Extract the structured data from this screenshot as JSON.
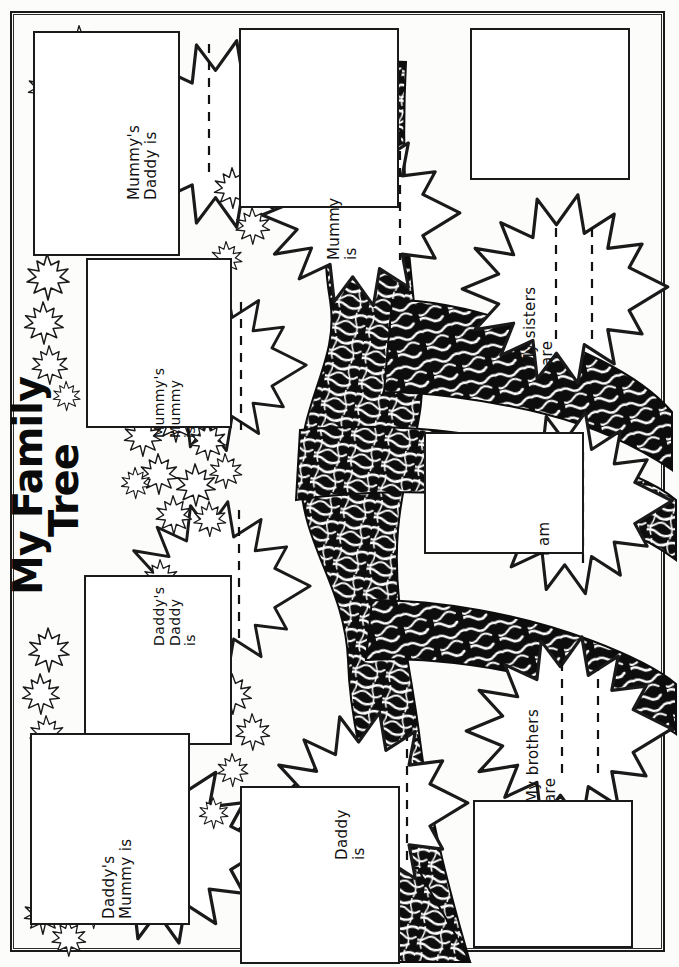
{
  "document": {
    "title_line1": "My Family",
    "title_line2": "Tree",
    "kind": "family-tree-worksheet",
    "orientation": "landscape-content-on-portrait-page",
    "ink_color": "#111111",
    "paper_color": "#fcfcfa"
  },
  "leaves": [
    {
      "id": "mummys-daddy",
      "label": "Mummy's\nDaddy is",
      "writing_lines": 1
    },
    {
      "id": "mummys-mummy",
      "label": "Mummy's\nMummy\nis",
      "writing_lines": 1
    },
    {
      "id": "daddys-daddy",
      "label": "Daddy's\nDaddy\nis",
      "writing_lines": 1
    },
    {
      "id": "daddys-mummy",
      "label": "Daddy's\nMummy is",
      "writing_lines": 1
    },
    {
      "id": "mummy",
      "label": "Mummy\nis",
      "writing_lines": 1
    },
    {
      "id": "daddy",
      "label": "Daddy\nis",
      "writing_lines": 1
    },
    {
      "id": "me",
      "label": "I am",
      "writing_lines": 1
    },
    {
      "id": "sisters",
      "label": "My sisters\nare",
      "writing_lines": 2
    },
    {
      "id": "brothers",
      "label": "My brothers\nare",
      "writing_lines": 2
    }
  ],
  "photo_boxes": [
    {
      "id": "photo-mummys-daddy"
    },
    {
      "id": "photo-mummys-mummy"
    },
    {
      "id": "photo-daddys-daddy"
    },
    {
      "id": "photo-daddys-mummy"
    },
    {
      "id": "photo-mummy"
    },
    {
      "id": "photo-daddy"
    },
    {
      "id": "photo-me"
    },
    {
      "id": "photo-sisters"
    },
    {
      "id": "photo-brothers"
    }
  ]
}
